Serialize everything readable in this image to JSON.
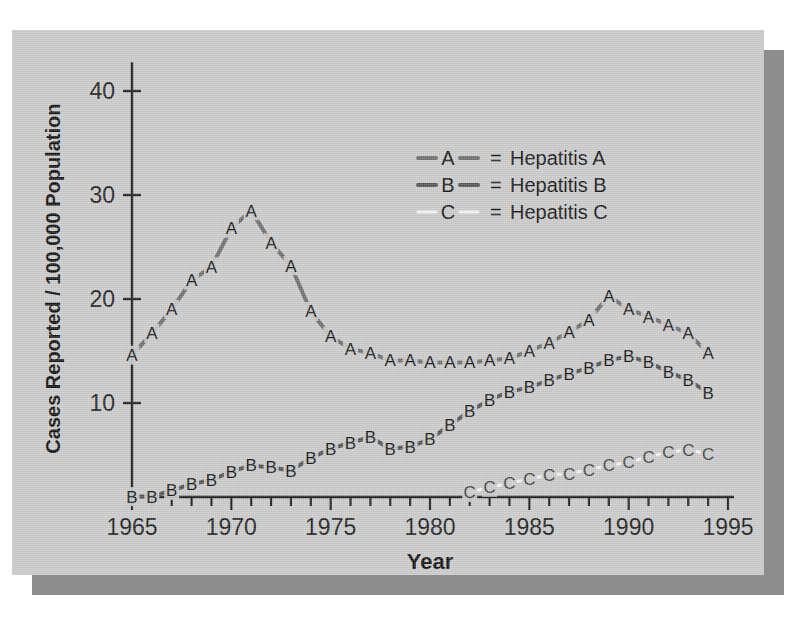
{
  "figure": {
    "background_color": "#c8c8c8",
    "page_color": "#ffffff",
    "shadow_color": "#8d8d8d",
    "axis_color": "#1a1a1a"
  },
  "axis_labels": {
    "x_title": "Year",
    "y_title": "Cases Reported / 100,000 Population"
  },
  "legend": {
    "entries": [
      {
        "marker": "A",
        "equals": "=",
        "label": "Hepatitis A",
        "color": "#6b6b6b"
      },
      {
        "marker": "B",
        "equals": "=",
        "label": "Hepatitis B",
        "color": "#4f4f4f"
      },
      {
        "marker": "C",
        "equals": "=",
        "label": "Hepatitis C",
        "color": "#f2f2f2"
      }
    ]
  },
  "chart_data": {
    "type": "line",
    "title": "",
    "xlabel": "Year",
    "ylabel": "Cases Reported / 100,000 Population",
    "xlim": [
      1965,
      1995
    ],
    "ylim": [
      0,
      42
    ],
    "xticks": [
      1965,
      1966,
      1967,
      1968,
      1969,
      1970,
      1971,
      1972,
      1973,
      1974,
      1975,
      1976,
      1977,
      1978,
      1979,
      1980,
      1981,
      1982,
      1983,
      1984,
      1985,
      1986,
      1987,
      1988,
      1989,
      1990,
      1991,
      1992,
      1993,
      1994,
      1995
    ],
    "xticklabels": [
      "1965",
      "",
      "",
      "",
      "",
      "1970",
      "",
      "",
      "",
      "",
      "1975",
      "",
      "",
      "",
      "",
      "1980",
      "",
      "",
      "",
      "",
      "1985",
      "",
      "",
      "",
      "",
      "1990",
      "",
      "",
      "",
      "",
      "1995"
    ],
    "yticks": [
      10,
      20,
      30,
      40
    ],
    "yticklabels": [
      "10",
      "20",
      "30",
      "40"
    ],
    "grid": false,
    "legend_position": "upper right",
    "marker_style": "letter",
    "series": [
      {
        "name": "Hepatitis A",
        "marker": "A",
        "color": "#6b6b6b",
        "x": [
          1965,
          1966,
          1967,
          1968,
          1969,
          1970,
          1971,
          1972,
          1973,
          1974,
          1975,
          1976,
          1977,
          1978,
          1979,
          1980,
          1981,
          1982,
          1983,
          1984,
          1985,
          1986,
          1987,
          1988,
          1989,
          1990,
          1991,
          1992,
          1993,
          1994
        ],
        "values": [
          14.6,
          16.7,
          19.0,
          21.8,
          23.1,
          26.8,
          28.5,
          25.4,
          23.2,
          18.8,
          16.4,
          15.2,
          14.8,
          14.1,
          14.1,
          13.9,
          13.9,
          13.9,
          14.1,
          14.3,
          15.0,
          15.8,
          16.8,
          18.0,
          20.3,
          19.0,
          18.3,
          17.5,
          16.7,
          14.8
        ]
      },
      {
        "name": "Hepatitis B",
        "marker": "B",
        "color": "#4f4f4f",
        "x": [
          1965,
          1966,
          1967,
          1968,
          1969,
          1970,
          1971,
          1972,
          1973,
          1974,
          1975,
          1976,
          1977,
          1978,
          1979,
          1980,
          1981,
          1982,
          1983,
          1984,
          1985,
          1986,
          1987,
          1988,
          1989,
          1990,
          1991,
          1992,
          1993,
          1994
        ],
        "values": [
          1.0,
          1.0,
          1.6,
          2.2,
          2.6,
          3.4,
          4.0,
          3.8,
          3.5,
          4.7,
          5.6,
          6.2,
          6.7,
          5.6,
          5.8,
          6.5,
          7.9,
          9.2,
          10.3,
          11.1,
          11.5,
          12.2,
          12.8,
          13.4,
          14.1,
          14.5,
          13.9,
          13.0,
          12.2,
          11.0
        ]
      },
      {
        "name": "Hepatitis C",
        "marker": "C",
        "color": "#f2f2f2",
        "x": [
          1982,
          1983,
          1984,
          1985,
          1986,
          1987,
          1988,
          1989,
          1990,
          1991,
          1992,
          1993,
          1994
        ],
        "values": [
          1.4,
          1.9,
          2.3,
          2.7,
          3.1,
          3.2,
          3.6,
          4.0,
          4.3,
          4.8,
          5.3,
          5.5,
          5.1
        ]
      }
    ]
  }
}
